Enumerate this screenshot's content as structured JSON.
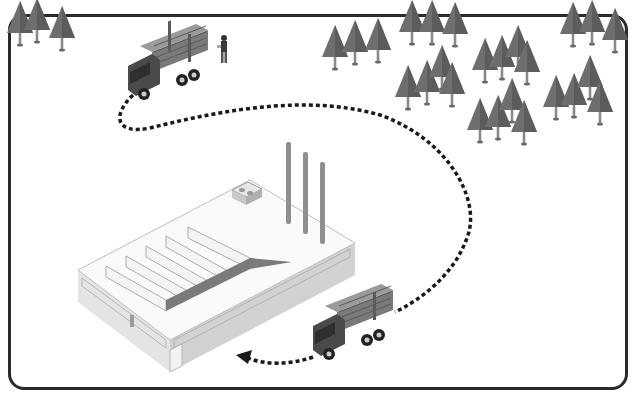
{
  "diagram": {
    "type": "isometric-illustration",
    "colors": {
      "frame": "#2a2a2a",
      "tree_fill": "#6e6e6e",
      "tree_trunk": "#8a8a8a",
      "truck_cab": "#4a4a4a",
      "logs": "#8c8c8c",
      "factory_roof": "#fafafa",
      "factory_wall": "#dcdcdc",
      "chimney": "#8f8f8f",
      "path": "#1a1a1a"
    },
    "nodes": [
      {
        "id": "forest",
        "label": "forest-icon"
      },
      {
        "id": "loading-truck",
        "label": "loaded-log-truck-icon"
      },
      {
        "id": "worker",
        "label": "worker-icon"
      },
      {
        "id": "factory",
        "label": "factory-icon"
      },
      {
        "id": "delivery-truck",
        "label": "loaded-log-truck-icon"
      }
    ],
    "edges": [
      {
        "from": "loading-truck",
        "to": "delivery-truck",
        "style": "dotted",
        "direction": "route"
      },
      {
        "from": "delivery-truck",
        "to": "factory",
        "style": "dotted",
        "arrow": "arrowhead"
      }
    ]
  }
}
